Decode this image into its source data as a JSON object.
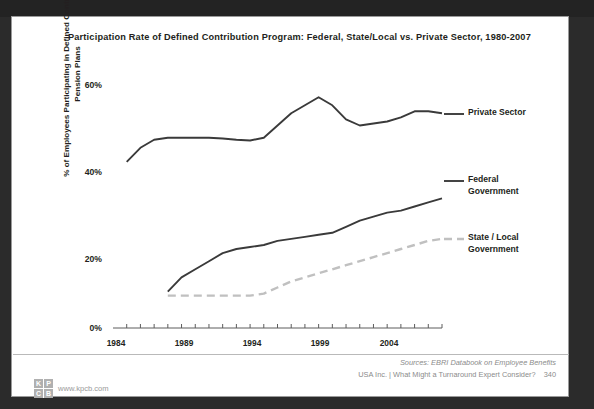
{
  "slide": {
    "title": "Participation Rate of Defined Contribution Program: Federal, State/Local vs. Private Sector, 1980-2007",
    "page_number": "340",
    "source_line": "Sources: EBRI Databook on Employee Benefits",
    "footer_line": "USA Inc. | What Might a Turnaround Expert Consider?",
    "logo": {
      "cell_1": "K",
      "cell_2": "P",
      "cell_3": "C",
      "cell_4": "B",
      "url": "www.kpcb.com"
    }
  },
  "chart_data": {
    "type": "line",
    "title": "Participation Rate of Defined Contribution Program: Federal, State/Local vs. Private Sector, 1980-2007",
    "xlabel": "",
    "ylabel": "% of Employees Participating in Defined Contribution Pension Plans",
    "xlim": [
      1983,
      2007
    ],
    "ylim": [
      0,
      65
    ],
    "ytick_labels": [
      "0%",
      "20%",
      "40%",
      "60%"
    ],
    "ytick_values": [
      0,
      20,
      40,
      60
    ],
    "xtick_labels": [
      "1984",
      "1989",
      "1994",
      "1999",
      "2004"
    ],
    "xtick_values": [
      1984,
      1989,
      1994,
      1999,
      2004
    ],
    "grid": false,
    "legend_position": "right-inline-labels",
    "series": [
      {
        "name": "Private Sector",
        "style": "solid",
        "color": "#3a3a3a",
        "x": [
          1984,
          1985,
          1986,
          1987,
          1988,
          1989,
          1990,
          1991,
          1992,
          1993,
          1994,
          1995,
          1996,
          1997,
          1998,
          1999,
          2000,
          2001,
          2002,
          2003,
          2004,
          2005,
          2006,
          2007
        ],
        "values": [
          41,
          44.5,
          46.5,
          47,
          47,
          47,
          47,
          46.8,
          46.5,
          46.3,
          47,
          50,
          53,
          55,
          57,
          55,
          51.5,
          50,
          50.5,
          51,
          52,
          53.5,
          53.5,
          53
        ]
      },
      {
        "name": "Federal Government",
        "style": "solid",
        "color": "#3a3a3a",
        "x": [
          1987,
          1988,
          1989,
          1990,
          1991,
          1992,
          1993,
          1994,
          1995,
          1996,
          1997,
          1998,
          1999,
          2000,
          2001,
          2002,
          2003,
          2004,
          2005,
          2006,
          2007
        ],
        "values": [
          9,
          12.5,
          14.5,
          16.5,
          18.5,
          19.5,
          20,
          20.5,
          21.5,
          22,
          22.5,
          23,
          23.5,
          25,
          26.5,
          27.5,
          28.5,
          29,
          30,
          31,
          32
        ]
      },
      {
        "name": "State / Local Government",
        "style": "dashed",
        "color": "#c0c0c0",
        "x": [
          1987,
          1988,
          1989,
          1990,
          1991,
          1992,
          1993,
          1994,
          1995,
          1996,
          1997,
          1998,
          1999,
          2000,
          2001,
          2002,
          2003,
          2004,
          2005,
          2006,
          2007
        ],
        "values": [
          8,
          8,
          8,
          8,
          8,
          8,
          8,
          8.5,
          10,
          11.5,
          12.5,
          13.5,
          14.5,
          15.5,
          16.5,
          17.5,
          18.5,
          19.5,
          20.5,
          21.5,
          22
        ]
      }
    ],
    "annotations": [
      {
        "text": "Private Sector",
        "series": "Private Sector"
      },
      {
        "text": "Federal\nGovernment",
        "series": "Federal Government"
      },
      {
        "text": "State / Local\nGovernment",
        "series": "State / Local Government"
      }
    ]
  }
}
